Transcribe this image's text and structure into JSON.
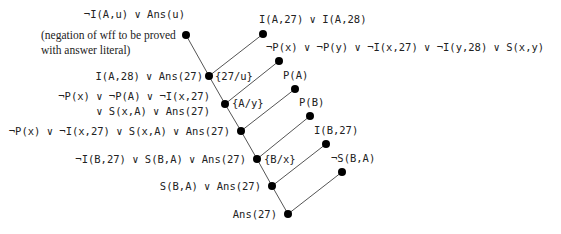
{
  "diagram": {
    "type": "resolution-refutation-tree",
    "nodes": [
      {
        "id": "goal",
        "x": 186,
        "y": 35,
        "label": "¬I(A,u) ∨ Ans(u)",
        "note_lines": [
          "(negation of wff to be proved",
          "with answer literal)"
        ]
      },
      {
        "id": "f1",
        "x": 263,
        "y": 34,
        "label": "I(A,27) ∨ I(A,28)"
      },
      {
        "id": "r1",
        "x": 209,
        "y": 76,
        "label": "I(A,28) ∨ Ans(27)",
        "subst": "{27/u}"
      },
      {
        "id": "f2",
        "x": 279,
        "y": 61,
        "label": "¬P(x) ∨ ¬P(y) ∨ ¬I(x,27) ∨ ¬I(y,28) ∨ S(x,y)"
      },
      {
        "id": "r2",
        "x": 225,
        "y": 104,
        "label_lines": [
          "¬P(x) ∨ ¬P(A) ∨ ¬I(x,27)",
          "∨ S(x,A) ∨ Ans(27)"
        ],
        "subst": "{A/y}"
      },
      {
        "id": "f3",
        "x": 295,
        "y": 89,
        "label": "P(A)"
      },
      {
        "id": "r3",
        "x": 241,
        "y": 131,
        "label": "¬P(x) ∨ ¬I(x,27) ∨ S(x,A) ∨ Ans(27)"
      },
      {
        "id": "f4",
        "x": 310,
        "y": 116,
        "label": "P(B)"
      },
      {
        "id": "r4",
        "x": 257,
        "y": 159,
        "label": "¬I(B,27) ∨ S(B,A) ∨ Ans(27)",
        "subst": "{B/x}"
      },
      {
        "id": "f5",
        "x": 326,
        "y": 144,
        "label": "I(B,27)"
      },
      {
        "id": "r5",
        "x": 272,
        "y": 186,
        "label": "S(B,A) ∨ Ans(27)"
      },
      {
        "id": "f6",
        "x": 342,
        "y": 172,
        "label": "¬S(B,A)"
      },
      {
        "id": "r6",
        "x": 288,
        "y": 214,
        "label": "Ans(27)"
      }
    ],
    "edges": [
      [
        "goal",
        "r1"
      ],
      [
        "f1",
        "r1"
      ],
      [
        "r1",
        "r2"
      ],
      [
        "f2",
        "r2"
      ],
      [
        "r2",
        "r3"
      ],
      [
        "f3",
        "r3"
      ],
      [
        "r3",
        "r4"
      ],
      [
        "f4",
        "r4"
      ],
      [
        "r4",
        "r5"
      ],
      [
        "f5",
        "r5"
      ],
      [
        "r5",
        "r6"
      ],
      [
        "f6",
        "r6"
      ]
    ],
    "colors": {
      "line": "#555555",
      "node": "#000000",
      "text": "#222222"
    }
  }
}
